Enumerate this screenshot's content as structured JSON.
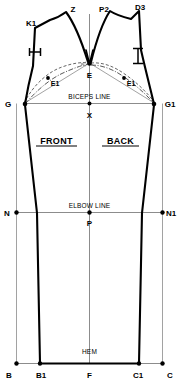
{
  "diagram": {
    "type": "sleeve-block-pattern",
    "width": 179,
    "height": 387,
    "background_color": "#ffffff",
    "line_color": "#000000",
    "construction_line_color": "#6e6e6e"
  },
  "sections": {
    "front_label": "FRONT",
    "back_label": "BACK"
  },
  "guide_lines": [
    {
      "name": "biceps",
      "label": "BICEPS LINE"
    },
    {
      "name": "elbow",
      "label": "ELBOW LINE"
    },
    {
      "name": "hem",
      "label": "HEM"
    }
  ],
  "points": {
    "K1": "K1",
    "Z": "Z",
    "P2": "P2",
    "D3": "D3",
    "E": "E",
    "E1_left": "E1",
    "E1_right": "E1",
    "G": "G",
    "G1": "G1",
    "X": "X",
    "N": "N",
    "N1": "N1",
    "P": "P",
    "B": "B",
    "B1": "B1",
    "F": "F",
    "C1": "C1",
    "C": "C"
  },
  "notations": {
    "left_tick": "H",
    "right_tick": "H"
  }
}
